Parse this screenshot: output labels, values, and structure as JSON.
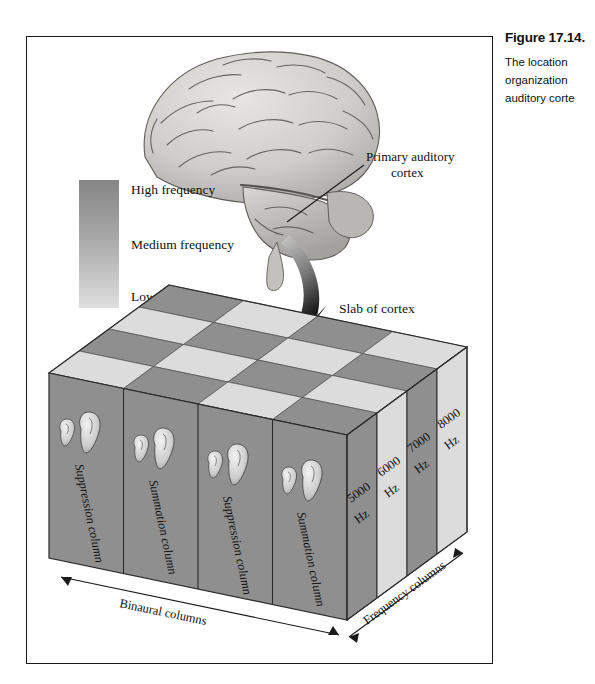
{
  "caption": {
    "title": "Figure 17.14.",
    "lines": [
      "The  location",
      "organization",
      "auditory corte"
    ]
  },
  "figure": {
    "brain_label": "Primary auditory cortex",
    "brain_label_line1": "Primary auditory",
    "brain_label_line2": "cortex",
    "slab_label": "Slab of cortex",
    "legend": {
      "high": "High frequency",
      "medium": "Medium frequency",
      "low": "Low frequency",
      "gradient_top_color": "#8f8f8f",
      "gradient_bottom_color": "#dcdcdc"
    },
    "axes": {
      "binaural": "Binaural columns",
      "frequency": "Frequency columns"
    },
    "binaural_columns": [
      {
        "label": "Suppression column"
      },
      {
        "label": "Summation column"
      },
      {
        "label": "Suppression column"
      },
      {
        "label": "Summation column"
      }
    ],
    "frequency_columns": [
      {
        "value": "5000",
        "unit": "Hz",
        "shade": "dark"
      },
      {
        "value": "6000",
        "unit": "Hz",
        "shade": "light"
      },
      {
        "value": "7000",
        "unit": "Hz",
        "shade": "dark"
      },
      {
        "value": "8000",
        "unit": "Hz",
        "shade": "light"
      }
    ],
    "colors": {
      "front_face": "#8f8f8f",
      "front_face_light": "#d6d6d6",
      "top_dark": "#8a8a8a",
      "top_light": "#d8d8d8",
      "side_dark": "#8c8c8c",
      "outline": "#2b2b2b"
    }
  }
}
